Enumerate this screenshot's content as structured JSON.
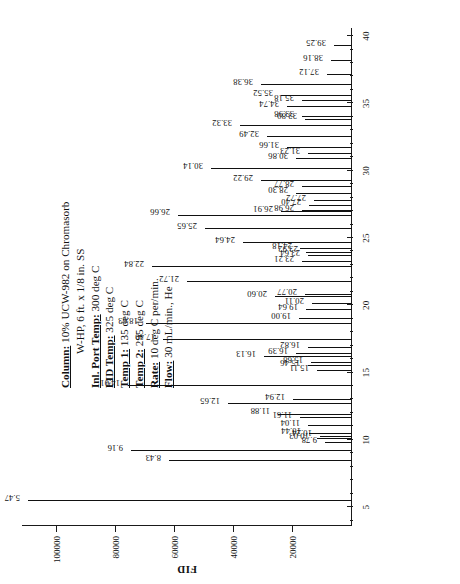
{
  "document": {
    "kind": "gas-chromatogram",
    "orientation": "rotated-90-ccw"
  },
  "caption": {
    "lines": [
      {
        "key": "Column:",
        "value": "10% UCW-982 on Chromasorb",
        "cont": "W-HP, 6 ft. x 1/8 in. SS"
      },
      {
        "key": "Inl. Port Temp:",
        "value": "300 deg C",
        "cont": ""
      },
      {
        "key": "FID Temp:",
        "value": "325 deg C",
        "cont": ""
      },
      {
        "key": "Temp 1:",
        "value": "135 deg C",
        "cont": ""
      },
      {
        "key": "Temp 2:",
        "value": "295 deg C",
        "cont": ""
      },
      {
        "key": "Rate:",
        "value": "10 deg C per/min.",
        "cont": ""
      },
      {
        "key": "Flow:",
        "value": "30 mL/min., He",
        "cont": ""
      }
    ]
  },
  "chart_data": {
    "type": "line",
    "title": "",
    "xlabel": "",
    "ylabel": "FID",
    "xlim": [
      3.6,
      40.6
    ],
    "ylim": [
      0,
      112000
    ],
    "grid": false,
    "legend": null,
    "x_ticks_major": [
      5,
      10,
      15,
      20,
      25,
      30,
      35,
      40
    ],
    "x_ticks_minor": [
      4,
      6,
      7,
      8,
      9,
      11,
      12,
      13,
      14,
      16,
      17,
      18,
      19,
      21,
      22,
      23,
      24,
      26,
      27,
      28,
      29,
      31,
      32,
      33,
      34,
      36,
      37,
      38,
      39
    ],
    "y_ticks": [
      20000,
      40000,
      60000,
      80000,
      100000
    ],
    "y_tick_labels": [
      "20000",
      "40000",
      "60000",
      "80000",
      "100000"
    ],
    "peaks": [
      {
        "rt": "5.47",
        "x": 5.47,
        "y": 110000,
        "labeled": true
      },
      {
        "rt": "8.43",
        "x": 8.43,
        "y": 62000,
        "labeled": true
      },
      {
        "rt": "9.16",
        "x": 9.16,
        "y": 75000,
        "labeled": true
      },
      {
        "rt": "9.78",
        "x": 9.78,
        "y": 9000,
        "labeled": true
      },
      {
        "rt": "10.03",
        "x": 10.03,
        "y": 12000,
        "labeled": true
      },
      {
        "rt": "10.24",
        "x": 10.24,
        "y": 11000,
        "labeled": true
      },
      {
        "rt": "10.44",
        "x": 10.44,
        "y": 14500,
        "labeled": true
      },
      {
        "rt": "11.04",
        "x": 11.04,
        "y": 15000,
        "labeled": true
      },
      {
        "rt": "11.61",
        "x": 11.61,
        "y": 17500,
        "labeled": true
      },
      {
        "rt": "11.88",
        "x": 11.88,
        "y": 25000,
        "labeled": true
      },
      {
        "rt": "12.65",
        "x": 12.65,
        "y": 42000,
        "labeled": true
      },
      {
        "rt": "12.94",
        "x": 12.94,
        "y": 20000,
        "labeled": true
      },
      {
        "rt": "14.01",
        "x": 14.01,
        "y": 76000,
        "labeled": true
      },
      {
        "rt": "15.11",
        "x": 15.11,
        "y": 12000,
        "labeled": true
      },
      {
        "rt": "15.46",
        "x": 15.46,
        "y": 15000,
        "labeled": true
      },
      {
        "rt": "15.68",
        "x": 15.68,
        "y": 14000,
        "labeled": true
      },
      {
        "rt": "16.13",
        "x": 16.13,
        "y": 30000,
        "labeled": true
      },
      {
        "rt": "16.39",
        "x": 16.39,
        "y": 19000,
        "labeled": true
      },
      {
        "rt": "16.82",
        "x": 16.82,
        "y": 15000,
        "labeled": true
      },
      {
        "rt": "17.40",
        "x": 17.4,
        "y": 64000,
        "labeled": true
      },
      {
        "rt": "18.63",
        "x": 18.63,
        "y": 70000,
        "labeled": true
      },
      {
        "rt": "19.00",
        "x": 19.0,
        "y": 18000,
        "labeled": true
      },
      {
        "rt": "19.64",
        "x": 19.64,
        "y": 15500,
        "labeled": true
      },
      {
        "rt": "20.11",
        "x": 20.11,
        "y": 13500,
        "labeled": true
      },
      {
        "rt": "20.60",
        "x": 20.6,
        "y": 26000,
        "labeled": true
      },
      {
        "rt": "20.77",
        "x": 20.77,
        "y": 16000,
        "labeled": true
      },
      {
        "rt": "21.72",
        "x": 21.72,
        "y": 56000,
        "labeled": true
      },
      {
        "rt": "22.84",
        "x": 22.84,
        "y": 68000,
        "labeled": true
      },
      {
        "rt": "23.21",
        "x": 23.21,
        "y": 17000,
        "labeled": true
      },
      {
        "rt": "23.64",
        "x": 23.64,
        "y": 15000,
        "labeled": true
      },
      {
        "rt": "23.92",
        "x": 23.92,
        "y": 15500,
        "labeled": true
      },
      {
        "rt": "24.18",
        "x": 24.18,
        "y": 17500,
        "labeled": true
      },
      {
        "rt": "24.64",
        "x": 24.64,
        "y": 37000,
        "labeled": true
      },
      {
        "rt": "25.65",
        "x": 25.65,
        "y": 50000,
        "labeled": true
      },
      {
        "rt": "26.91",
        "x": 26.91,
        "y": 24000,
        "labeled": true
      },
      {
        "rt": "26.66",
        "x": 26.66,
        "y": 59000,
        "labeled": true
      },
      {
        "rt": "26.98",
        "x": 26.98,
        "y": 17000,
        "labeled": true
      },
      {
        "rt": "27.40",
        "x": 27.4,
        "y": 14500,
        "labeled": true
      },
      {
        "rt": "27.72",
        "x": 27.72,
        "y": 13000,
        "labeled": true
      },
      {
        "rt": "28.30",
        "x": 28.3,
        "y": 19000,
        "labeled": true
      },
      {
        "rt": "28.77",
        "x": 28.77,
        "y": 17000,
        "labeled": true
      },
      {
        "rt": "29.22",
        "x": 29.22,
        "y": 31000,
        "labeled": true
      },
      {
        "rt": "30.14",
        "x": 30.14,
        "y": 48000,
        "labeled": true
      },
      {
        "rt": "30.86",
        "x": 30.86,
        "y": 19000,
        "labeled": true
      },
      {
        "rt": "31.23",
        "x": 31.23,
        "y": 15000,
        "labeled": true
      },
      {
        "rt": "31.66",
        "x": 31.66,
        "y": 22000,
        "labeled": true
      },
      {
        "rt": "32.49",
        "x": 32.49,
        "y": 29000,
        "labeled": true
      },
      {
        "rt": "33.32",
        "x": 33.32,
        "y": 38000,
        "labeled": true
      },
      {
        "rt": "33.80",
        "x": 33.8,
        "y": 16000,
        "labeled": true
      },
      {
        "rt": "33.98",
        "x": 33.98,
        "y": 17000,
        "labeled": true
      },
      {
        "rt": "34.74",
        "x": 34.74,
        "y": 22000,
        "labeled": true
      },
      {
        "rt": "35.18",
        "x": 35.18,
        "y": 17000,
        "labeled": true
      },
      {
        "rt": "35.52",
        "x": 35.52,
        "y": 24000,
        "labeled": true
      },
      {
        "rt": "36.38",
        "x": 36.38,
        "y": 31000,
        "labeled": true
      },
      {
        "rt": "37.12",
        "x": 37.12,
        "y": 8500,
        "labeled": true
      },
      {
        "rt": "38.16",
        "x": 38.16,
        "y": 7000,
        "labeled": true
      },
      {
        "rt": "39.25",
        "x": 39.25,
        "y": 6000,
        "labeled": true
      }
    ]
  }
}
